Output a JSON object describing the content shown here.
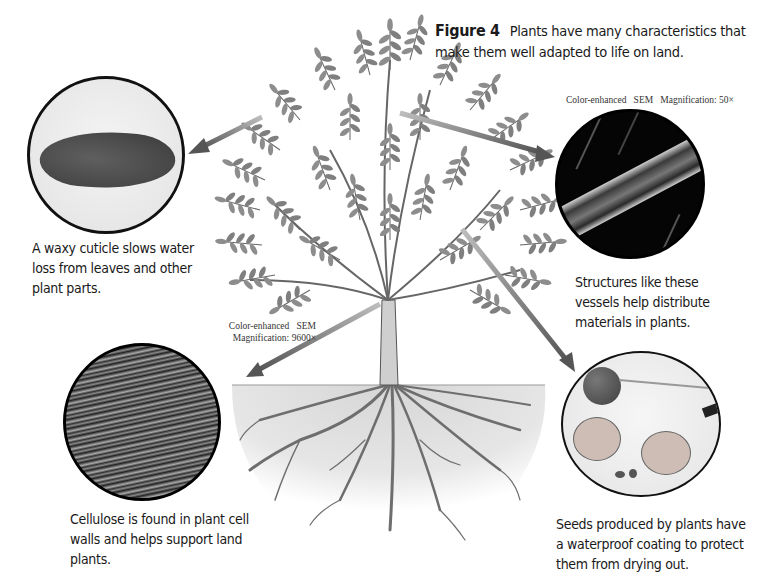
{
  "figure": {
    "number_label": "Figure 4",
    "caption": "Plants have many characteristics that make them well adapted to life on land."
  },
  "panels": [
    {
      "id": "cuticle",
      "image_subject": "leaf with waxy cuticle",
      "sem_label": "",
      "description": "A waxy cuticle slows water loss from leaves and other plant parts."
    },
    {
      "id": "vessels",
      "image_subject": "vascular vessel SEM",
      "sem_label": "Color-enhanced   SEM   Magnification: 50×",
      "description": "Structures like these vessels help distribute materials in plants."
    },
    {
      "id": "cellulose",
      "image_subject": "cellulose fibers SEM",
      "sem_label_line1": "Color-enhanced   SEM",
      "sem_label_line2": "Magnification: 9600×",
      "description": "Cellulose is found in plant cell walls and helps support land plants."
    },
    {
      "id": "seeds",
      "image_subject": "cherries cut open showing seeds",
      "sem_label": "",
      "description": "Seeds produced by plants have a waterproof coating to protect them from drying out."
    }
  ],
  "colors": {
    "text": "#1a1a1a",
    "arrow": "#6e6e6e",
    "circle_border": "#111111",
    "soil": "#dcdcdc",
    "leaf": "#8a8a8a"
  }
}
